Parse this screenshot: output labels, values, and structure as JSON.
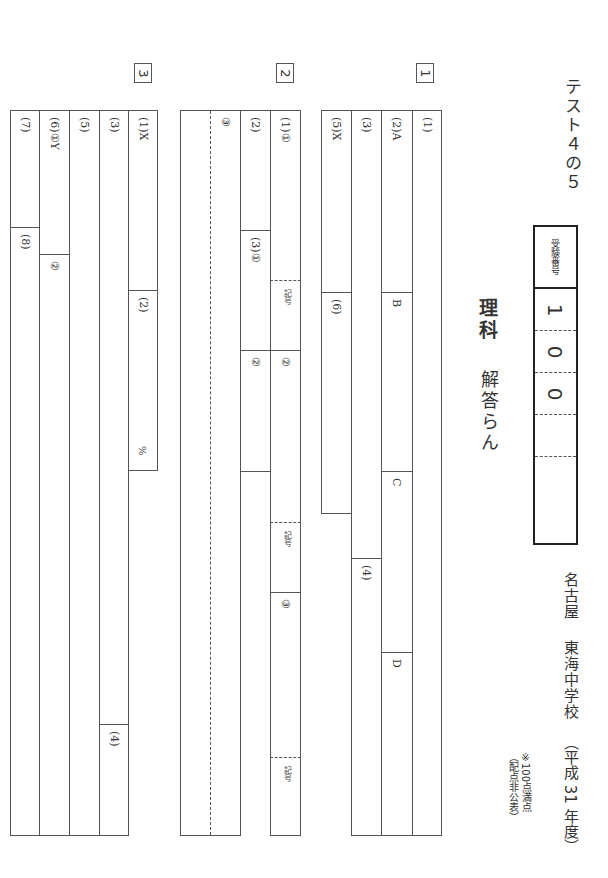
{
  "header": {
    "test_label": "テスト４の５",
    "subject": "理科",
    "subtitle": "解答らん",
    "school_city": "名古屋",
    "school_name": "東海中学校",
    "year": "（平成 31 年度）",
    "note_line1": "※100点満点",
    "note_line2": "（配点非公表）"
  },
  "exam_number": {
    "label": "受験番号",
    "digits": [
      "1",
      "0",
      "0",
      "",
      ""
    ]
  },
  "sections": [
    {
      "number": "1",
      "labels": {
        "q1": "(1)",
        "q2a": "(2)A",
        "q2b": "B",
        "q2c": "C",
        "q2d": "D",
        "q3": "(3)",
        "q4": "(4)",
        "q5x": "(5)X",
        "q6": "(6)"
      }
    },
    {
      "number": "2",
      "labels": {
        "q1_1": "(1)①",
        "q1_kigou1": "記号",
        "q1_2": "②",
        "q1_kigou2": "記号",
        "q1_3": "③",
        "q1_kigou3": "記号",
        "q2": "(2)",
        "q3_1": "(3)①",
        "q3_2": "②",
        "q3_3": "③"
      }
    },
    {
      "number": "3",
      "labels": {
        "q1x": "(1)X",
        "q2": "(2)",
        "q2_unit": "%",
        "q3": "(3)",
        "q4": "(4)",
        "q5": "(5)",
        "q6_1y": "(6)①Y",
        "q6_2": "②",
        "q7": "(7)",
        "q8": "(8)"
      }
    }
  ]
}
